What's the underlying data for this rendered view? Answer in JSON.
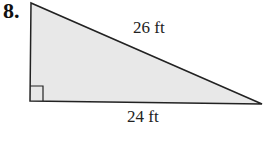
{
  "problem_number": "8.",
  "shape": "right triangle",
  "labels": {
    "hypotenuse": "26 ft",
    "base": "24 ft"
  },
  "colors": {
    "fill": "#e8e8e8",
    "stroke": "#222222"
  }
}
